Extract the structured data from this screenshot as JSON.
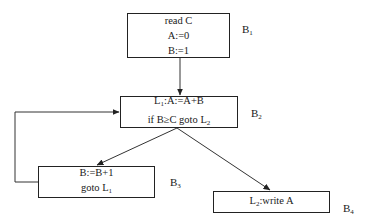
{
  "diagram": {
    "type": "control-flow-graph",
    "blocks": [
      {
        "id": "B1",
        "label": "B",
        "label_sub": "1",
        "lines": [
          {
            "text": "read C"
          },
          {
            "text": "A:=0"
          },
          {
            "text": "B:=1"
          }
        ]
      },
      {
        "id": "B2",
        "label": "B",
        "label_sub": "2",
        "lines": [
          {
            "pre": "L",
            "sub": "1",
            "post": ":A:=A+B"
          },
          {
            "pre": "if B≥C goto L",
            "sub": "2",
            "post": ""
          }
        ]
      },
      {
        "id": "B3",
        "label": "B",
        "label_sub": "3",
        "lines": [
          {
            "pre": "B:=B+1",
            "sub": "",
            "post": ""
          },
          {
            "pre": "goto L",
            "sub": "1",
            "post": ""
          }
        ]
      },
      {
        "id": "B4",
        "label": "B",
        "label_sub": "4",
        "lines": [
          {
            "pre": "L",
            "sub": "2",
            "post": ":write A"
          }
        ]
      }
    ],
    "edges": [
      {
        "from": "B1",
        "to": "B2"
      },
      {
        "from": "B2",
        "to": "B3"
      },
      {
        "from": "B2",
        "to": "B4"
      },
      {
        "from": "B3",
        "to": "B2"
      }
    ]
  }
}
